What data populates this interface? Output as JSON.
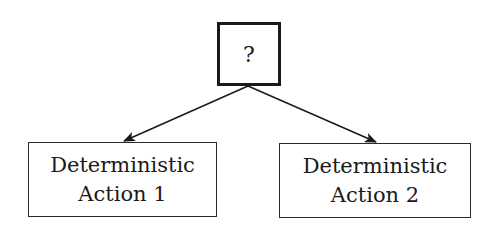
{
  "diagram": {
    "root": {
      "label": "?"
    },
    "children": [
      {
        "line1": "Deterministic",
        "line2": "Action 1"
      },
      {
        "line1": "Deterministic",
        "line2": "Action 2"
      }
    ],
    "edges": [
      {
        "from": "root",
        "to": "child-1",
        "style": "arrow"
      },
      {
        "from": "root",
        "to": "child-2",
        "style": "arrow"
      }
    ],
    "colors": {
      "stroke": "#1a1a1a",
      "background": "#ffffff"
    }
  }
}
